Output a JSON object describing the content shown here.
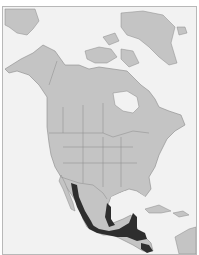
{
  "map": {
    "region": "North America",
    "colors": {
      "ocean": "#f2f2f2",
      "land": "#c4c4c4",
      "borders": "#8a8a8a",
      "range": "#2e2e2e",
      "frame": "#b8b8b8"
    },
    "highlighted_range": {
      "description": "Species distribution range",
      "areas": [
        "Western Mexico (Pacific slope)",
        "Eastern Mexico (Gulf slope)",
        "Southern Mexico",
        "Yucatan Peninsula",
        "Central America"
      ]
    }
  }
}
